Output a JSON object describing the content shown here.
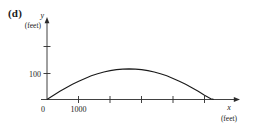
{
  "figure": {
    "panel_label": "(d)",
    "background_color": "#ffffff",
    "ink_color": "#1a1a1a"
  },
  "chart_data": {
    "type": "line",
    "title": "",
    "subtitle": "",
    "panel": "(d)",
    "xlabel": "x",
    "xunit": "(feet)",
    "ylabel": "y",
    "yunit": "(feet)",
    "xlim": [
      0,
      5600
    ],
    "ylim": [
      0,
      210
    ],
    "grid": false,
    "legend": null,
    "x_tick_values": [
      0,
      1000,
      2000,
      3000,
      4000,
      5000
    ],
    "x_tick_labels": [
      "0",
      "1000",
      "",
      "",
      "",
      ""
    ],
    "y_tick_values": [
      100,
      200
    ],
    "y_tick_labels": [
      "100",
      ""
    ],
    "origin_label": "0",
    "series": [
      {
        "name": "projectile-path",
        "description": "parabolic arc from origin to landing point",
        "x": [
          0,
          200,
          400,
          600,
          800,
          1000,
          1200,
          1400,
          1600,
          1800,
          2000,
          2200,
          2400,
          2600,
          2800,
          3000,
          3200,
          3400,
          3600,
          3800,
          4000,
          4200,
          4400,
          4600,
          4800,
          5000,
          5200,
          5280
        ],
        "y": [
          0,
          16,
          31,
          45,
          58,
          70,
          81,
          91,
          99,
          106,
          111,
          115,
          117,
          118,
          117,
          115,
          111,
          106,
          99,
          91,
          81,
          70,
          58,
          45,
          31,
          16,
          2,
          0
        ]
      }
    ],
    "annotations": {
      "apex_x": 2640,
      "apex_y": 118,
      "landing_x": 5280
    }
  },
  "labels": {
    "y_axis_var": "y",
    "y_axis_unit": "(feet)",
    "x_axis_var": "x",
    "x_axis_unit": "(feet)",
    "y_tick_100": "100",
    "x_tick_1000": "1000",
    "origin": "0"
  }
}
